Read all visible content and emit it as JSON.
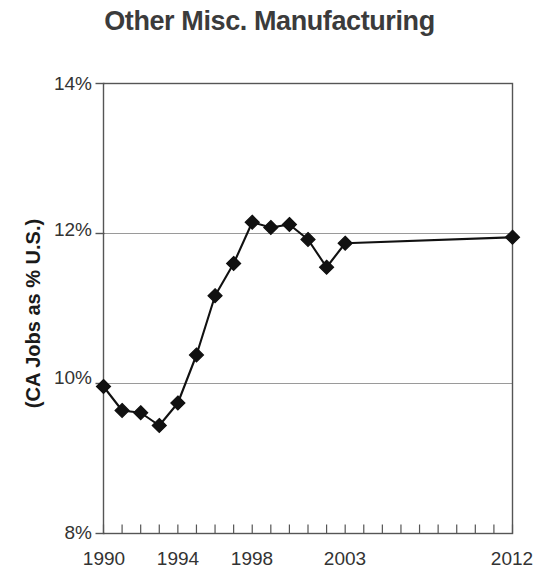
{
  "chart_data": {
    "type": "line",
    "title": "Other Misc. Manufacturing",
    "xlabel": "",
    "ylabel": "(CA Jobs as % U.S.)",
    "ylim": [
      8,
      14
    ],
    "xlim": [
      1990,
      2012
    ],
    "yticks": [
      8,
      10,
      12,
      14
    ],
    "ytick_labels": [
      "8%",
      "10%",
      "12%",
      "14%"
    ],
    "xtick_labels": [
      "1990",
      "1994",
      "1998",
      "2003",
      "2012"
    ],
    "xtick_label_years": [
      1990,
      1994,
      1998,
      2003,
      2012
    ],
    "grid": "horizontal",
    "gridlines_at": [
      10,
      12
    ],
    "legend": "none",
    "marker": "diamond",
    "marker_color": "#111111",
    "line_color": "#111111",
    "x": [
      1990,
      1991,
      1992,
      1993,
      1994,
      1995,
      1996,
      1997,
      1998,
      1999,
      2000,
      2001,
      2002,
      2003,
      2012
    ],
    "values": [
      9.96,
      9.64,
      9.61,
      9.44,
      9.74,
      10.38,
      11.17,
      11.6,
      12.15,
      12.08,
      12.12,
      11.92,
      11.55,
      11.87,
      11.95
    ],
    "series": [
      {
        "name": "CA Jobs as % U.S.",
        "x": [
          1990,
          1991,
          1992,
          1993,
          1994,
          1995,
          1996,
          1997,
          1998,
          1999,
          2000,
          2001,
          2002,
          2003,
          2012
        ],
        "values": [
          9.96,
          9.64,
          9.61,
          9.44,
          9.74,
          10.38,
          11.17,
          11.6,
          12.15,
          12.08,
          12.12,
          11.92,
          11.55,
          11.87,
          11.95
        ]
      }
    ],
    "minor_xticks_every": 1,
    "annotations": []
  },
  "axis": {
    "ytick_0": "8%",
    "ytick_1": "10%",
    "ytick_2": "12%",
    "ytick_3": "14%",
    "xtick_0": "1990",
    "xtick_1": "1994",
    "xtick_2": "1998",
    "xtick_3": "2003",
    "xtick_4": "2012"
  },
  "colors": {
    "title": "#3b3b3b",
    "axis": "#555555",
    "grid": "#9a9a9a",
    "data": "#111111",
    "background": "#ffffff"
  }
}
